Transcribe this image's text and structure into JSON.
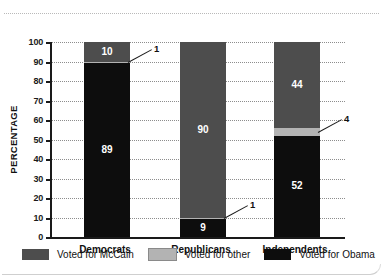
{
  "chart_data": {
    "type": "bar",
    "subtype": "stacked-bar-100",
    "title": "",
    "xlabel": "",
    "ylabel": "PERCENTAGE",
    "ylim": [
      0,
      100
    ],
    "yticks": [
      0,
      10,
      20,
      30,
      40,
      50,
      60,
      70,
      80,
      90,
      100
    ],
    "grid": true,
    "legend_position": "bottom",
    "categories": [
      "Democrats",
      "Republicans",
      "Independents"
    ],
    "series": [
      {
        "name": "Voted for Obama",
        "color": "#0d0d0d",
        "values": [
          89,
          9,
          52
        ]
      },
      {
        "name": "Voted for other",
        "color": "#b3b3b3",
        "values": [
          1,
          1,
          4
        ]
      },
      {
        "name": "Voted for McCain",
        "color": "#4d4d4d",
        "values": [
          10,
          90,
          44
        ]
      }
    ],
    "annotations": [
      {
        "text": "1",
        "series": "Voted for other",
        "category": "Democrats"
      },
      {
        "text": "1",
        "series": "Voted for other",
        "category": "Republicans"
      },
      {
        "text": "4",
        "series": "Voted for other",
        "category": "Independents"
      }
    ]
  },
  "axis": {
    "ylabel": "PERCENTAGE",
    "ticks": [
      "100",
      "90",
      "80",
      "70",
      "60",
      "50",
      "40",
      "30",
      "20",
      "10",
      "0"
    ]
  },
  "bars": [
    {
      "category": "Democrats",
      "segments": [
        {
          "label": "89",
          "value": 89,
          "series": "Voted for Obama",
          "show_label": true
        },
        {
          "label": "1",
          "value": 1,
          "series": "Voted for other",
          "show_label": false
        },
        {
          "label": "10",
          "value": 10,
          "series": "Voted for McCain",
          "show_label": true
        }
      ],
      "callout": "1"
    },
    {
      "category": "Republicans",
      "segments": [
        {
          "label": "9",
          "value": 9,
          "series": "Voted for Obama",
          "show_label": true
        },
        {
          "label": "1",
          "value": 1,
          "series": "Voted for other",
          "show_label": false
        },
        {
          "label": "90",
          "value": 90,
          "series": "Voted for McCain",
          "show_label": true
        }
      ],
      "callout": "1"
    },
    {
      "category": "Independents",
      "segments": [
        {
          "label": "52",
          "value": 52,
          "series": "Voted for Obama",
          "show_label": true
        },
        {
          "label": "4",
          "value": 4,
          "series": "Voted for other",
          "show_label": false
        },
        {
          "label": "44",
          "value": 44,
          "series": "Voted for McCain",
          "show_label": true
        }
      ],
      "callout": "4"
    }
  ],
  "legend": [
    {
      "label": "Voted for McCain",
      "color": "#4d4d4d"
    },
    {
      "label": "Voted for other",
      "color": "#b3b3b3"
    },
    {
      "label": "Voted for Obama",
      "color": "#0d0d0d"
    }
  ],
  "colors": {
    "mccain": "#4d4d4d",
    "other": "#b3b3b3",
    "obama": "#0d0d0d",
    "axis": "#1a1a1a",
    "grid": "#8d8d8d",
    "text": "#111111"
  }
}
